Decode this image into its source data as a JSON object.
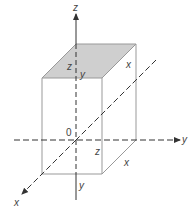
{
  "diagram": {
    "type": "3d-coordinate-box",
    "axes": {
      "z": {
        "label": "z"
      },
      "y": {
        "label": "y"
      },
      "x": {
        "label": "x"
      },
      "origin": {
        "label": "0"
      }
    },
    "box": {
      "top_face_fill": "#cfcfcf",
      "labels": {
        "top_z": "z",
        "top_y": "y",
        "top_x": "x",
        "side_z": "z",
        "bottom_x": "x",
        "bottom_y": "y"
      }
    },
    "colors": {
      "line": "#555555",
      "box_edge": "#999999",
      "shaded": "#cfcfcf"
    }
  }
}
